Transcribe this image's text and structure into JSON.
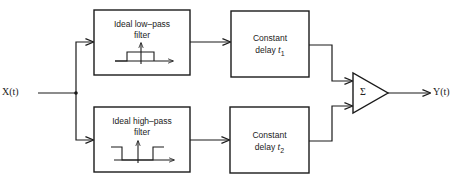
{
  "diagram": {
    "input_signal": "X(t)",
    "output_signal": "Y(t)",
    "blocks": {
      "lowpass": {
        "line1": "Ideal low–pass",
        "line2": "filter"
      },
      "highpass": {
        "line1": "Ideal high–pass",
        "line2": "filter"
      },
      "delay1": {
        "line1": "Constant",
        "line2_prefix": "delay ",
        "var": "t",
        "sub": "1"
      },
      "delay2": {
        "line1": "Constant",
        "line2_prefix": "delay ",
        "var": "t",
        "sub": "2"
      },
      "summer": {
        "symbol": "Σ"
      }
    },
    "colors": {
      "stroke": "#1a1a1a",
      "background": "#ffffff"
    }
  }
}
